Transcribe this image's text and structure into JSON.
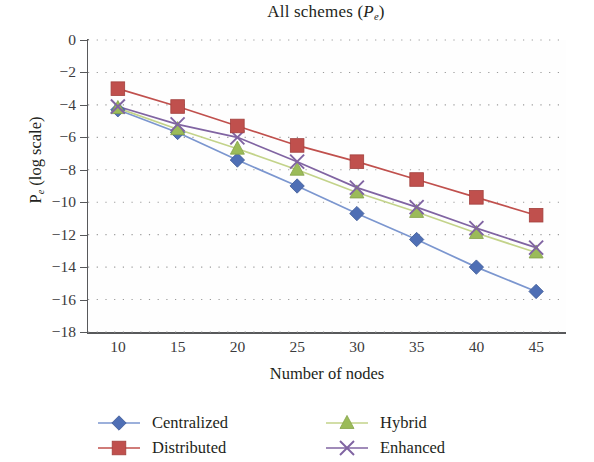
{
  "chart_data": {
    "type": "line",
    "title": "All schemes (Pe)",
    "title_main": "All schemes (",
    "title_symbol": "P",
    "title_sub": "e",
    "title_close": ")",
    "xlabel": "Number of nodes",
    "ylabel": "Pe (log scale)",
    "ylabel_symbol": "P",
    "ylabel_sub": "e",
    "ylabel_rest": " (log scale)",
    "x": [
      10,
      15,
      20,
      25,
      30,
      35,
      40,
      45
    ],
    "categories": [
      "10",
      "15",
      "20",
      "25",
      "30",
      "35",
      "40",
      "45"
    ],
    "xlim": [
      7.5,
      47.5
    ],
    "ylim": [
      -18,
      0
    ],
    "yticks": [
      0,
      -2,
      -4,
      -6,
      -8,
      -10,
      -12,
      -14,
      -16,
      -18
    ],
    "ytick_labels": [
      "0",
      "−2",
      "−4",
      "−6",
      "−8",
      "−10",
      "−12",
      "−14",
      "−16",
      "−18"
    ],
    "grid": "dotted-horizontal",
    "legend_position": "below-plot-two-columns",
    "series": [
      {
        "name": "Centralized",
        "marker": "diamond",
        "color": "#4f6fb5",
        "line_color": "#7b96cf",
        "values": [
          -4.3,
          -5.7,
          -7.4,
          -9.0,
          -10.7,
          -12.3,
          -14.0,
          -15.5
        ]
      },
      {
        "name": "Distributed",
        "marker": "square",
        "color": "#c0504d",
        "line_color": "#c0504d",
        "values": [
          -3.0,
          -4.1,
          -5.3,
          -6.5,
          -7.5,
          -8.6,
          -9.7,
          -10.8
        ]
      },
      {
        "name": "Hybrid",
        "marker": "triangle",
        "color": "#9bbb59",
        "line_color": "#c3d38a",
        "values": [
          -4.2,
          -5.5,
          -6.7,
          -8.0,
          -9.4,
          -10.6,
          -11.9,
          -13.1
        ]
      },
      {
        "name": "Enhanced",
        "marker": "x-cross",
        "color": "#8064a2",
        "line_color": "#8064a2",
        "values": [
          -4.1,
          -5.2,
          -6.0,
          -7.5,
          -9.1,
          -10.3,
          -11.6,
          -12.8
        ]
      }
    ]
  },
  "legend": {
    "items": [
      {
        "label": "Centralized"
      },
      {
        "label": "Distributed"
      },
      {
        "label": "Hybrid"
      },
      {
        "label": "Enhanced"
      }
    ]
  }
}
